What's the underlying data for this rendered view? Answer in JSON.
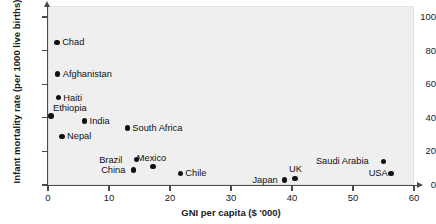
{
  "chart_data": {
    "type": "scatter",
    "title": "",
    "xlabel": "GNI per capita ($ '000)",
    "ylabel": "Infant mortality rate (per 1000 live births)",
    "xlim": [
      0,
      62
    ],
    "ylim": [
      0,
      107
    ],
    "xticks": [
      0,
      10,
      20,
      30,
      40,
      50,
      60
    ],
    "yticks": [
      0,
      20,
      40,
      60,
      80,
      100
    ],
    "grid": false,
    "legend": "none",
    "marker_color": "#111111",
    "panel_background": "#efefef",
    "points": [
      {
        "label": "Chad",
        "x": 1.5,
        "y": 85,
        "label_pos": "right"
      },
      {
        "label": "Afghanistan",
        "x": 1.6,
        "y": 66,
        "label_pos": "right"
      },
      {
        "label": "Haiti",
        "x": 1.7,
        "y": 52,
        "label_pos": "right"
      },
      {
        "label": "Ethiopia",
        "x": 0.5,
        "y": 41,
        "label_pos": "above-right"
      },
      {
        "label": "India",
        "x": 6.0,
        "y": 38,
        "label_pos": "right"
      },
      {
        "label": "Nepal",
        "x": 2.3,
        "y": 29,
        "label_pos": "right"
      },
      {
        "label": "South Africa",
        "x": 13.0,
        "y": 34,
        "label_pos": "right"
      },
      {
        "label": "Brazil",
        "x": 14.5,
        "y": 15,
        "label_pos": "left"
      },
      {
        "label": "Mexico",
        "x": 17.2,
        "y": 11,
        "label_pos": "above"
      },
      {
        "label": "China",
        "x": 14.0,
        "y": 9,
        "label_pos": "left"
      },
      {
        "label": "Chile",
        "x": 21.7,
        "y": 7,
        "label_pos": "right"
      },
      {
        "label": "Japan",
        "x": 38.8,
        "y": 3,
        "label_pos": "left"
      },
      {
        "label": "UK",
        "x": 40.5,
        "y": 4,
        "label_pos": "above"
      },
      {
        "label": "Saudi Arabia",
        "x": 55.0,
        "y": 14,
        "label_pos": "left"
      },
      {
        "label": "USA",
        "x": 56.2,
        "y": 7,
        "label_pos": "left"
      }
    ]
  }
}
